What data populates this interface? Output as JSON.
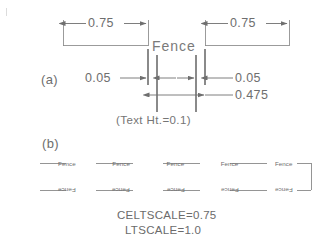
{
  "figure": {
    "title_note": "(Text Ht.=0.1)",
    "background_color": "#ffffff",
    "line_color": "#7a7a7a",
    "text_color": "#6b6b6b"
  },
  "panel_a": {
    "label": "(a)",
    "linetype_text": "Fence",
    "dimensions": {
      "dash_left": "0.75",
      "dash_right": "0.75",
      "gap_left": "0.05",
      "gap_right": "0.05",
      "text_width": "0.475"
    },
    "note": "(Text Ht.=0.1)"
  },
  "panel_b": {
    "label": "(b)",
    "upper_line_labels": [
      "Fence",
      "Fence",
      "Fence",
      "Fence",
      "Fence"
    ],
    "lower_line_labels": [
      "Fence",
      "Fence",
      "Fence",
      "Fence",
      "Fence"
    ]
  },
  "settings": {
    "celtscale": "CELTSCALE=0.75",
    "ltscale": "LTSCALE=1.0"
  }
}
